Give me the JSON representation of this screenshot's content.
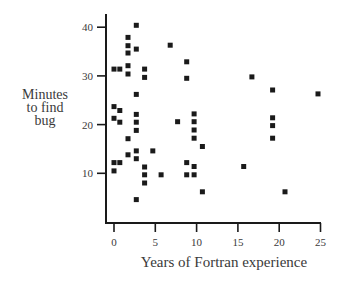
{
  "chart_data": {
    "type": "scatter",
    "title": "",
    "xlabel": "Years of Fortran experience",
    "ylabel": "Minutes to find bug",
    "ylabel_lines": [
      "Minutes",
      "to find",
      "bug"
    ],
    "xlim": [
      0,
      25
    ],
    "ylim": [
      0,
      40
    ],
    "xticks": [
      0,
      5,
      10,
      15,
      20,
      25
    ],
    "yticks": [
      10,
      20,
      30,
      40
    ],
    "grid": false,
    "legend": null,
    "marker": "square",
    "marker_color": "#1a1a1a",
    "points": [
      {
        "x": 2.7,
        "y": 40.4
      },
      {
        "x": 1.7,
        "y": 37.9
      },
      {
        "x": 1.7,
        "y": 36.2
      },
      {
        "x": 2.7,
        "y": 35.5
      },
      {
        "x": 1.7,
        "y": 34.7
      },
      {
        "x": 0.0,
        "y": 31.4
      },
      {
        "x": 0.7,
        "y": 31.4
      },
      {
        "x": 1.7,
        "y": 32.1
      },
      {
        "x": 1.7,
        "y": 30.4
      },
      {
        "x": 3.7,
        "y": 31.4
      },
      {
        "x": 3.7,
        "y": 29.7
      },
      {
        "x": 2.7,
        "y": 26.2
      },
      {
        "x": 0.0,
        "y": 23.7
      },
      {
        "x": 0.7,
        "y": 22.9
      },
      {
        "x": 2.7,
        "y": 22.1
      },
      {
        "x": 0.0,
        "y": 21.3
      },
      {
        "x": 0.7,
        "y": 20.5
      },
      {
        "x": 2.7,
        "y": 20.5
      },
      {
        "x": 2.7,
        "y": 18.8
      },
      {
        "x": 1.7,
        "y": 17.1
      },
      {
        "x": 2.7,
        "y": 14.6
      },
      {
        "x": 4.7,
        "y": 14.6
      },
      {
        "x": 1.7,
        "y": 13.8
      },
      {
        "x": 2.7,
        "y": 13.0
      },
      {
        "x": 0.0,
        "y": 12.2
      },
      {
        "x": 0.7,
        "y": 12.2
      },
      {
        "x": 0.0,
        "y": 10.5
      },
      {
        "x": 3.7,
        "y": 11.3
      },
      {
        "x": 3.7,
        "y": 9.7
      },
      {
        "x": 5.7,
        "y": 9.7
      },
      {
        "x": 3.7,
        "y": 8.0
      },
      {
        "x": 2.7,
        "y": 4.6
      },
      {
        "x": 6.8,
        "y": 36.3
      },
      {
        "x": 8.8,
        "y": 32.9
      },
      {
        "x": 8.8,
        "y": 29.5
      },
      {
        "x": 7.7,
        "y": 20.6
      },
      {
        "x": 9.7,
        "y": 22.2
      },
      {
        "x": 9.7,
        "y": 20.6
      },
      {
        "x": 9.7,
        "y": 18.9
      },
      {
        "x": 9.7,
        "y": 17.2
      },
      {
        "x": 10.7,
        "y": 15.5
      },
      {
        "x": 8.8,
        "y": 12.2
      },
      {
        "x": 9.7,
        "y": 11.4
      },
      {
        "x": 8.8,
        "y": 9.7
      },
      {
        "x": 9.7,
        "y": 9.7
      },
      {
        "x": 10.7,
        "y": 6.2
      },
      {
        "x": 16.7,
        "y": 29.8
      },
      {
        "x": 19.2,
        "y": 27.1
      },
      {
        "x": 24.7,
        "y": 26.3
      },
      {
        "x": 19.2,
        "y": 21.4
      },
      {
        "x": 19.2,
        "y": 19.8
      },
      {
        "x": 19.2,
        "y": 17.2
      },
      {
        "x": 15.7,
        "y": 11.4
      },
      {
        "x": 20.7,
        "y": 6.2
      }
    ]
  },
  "layout": {
    "origin_px": [
      114,
      222
    ],
    "px_per_x": 8.26,
    "px_per_y": 4.87,
    "axis_left_px": 106,
    "axis_top_px": 14,
    "axis_right_px": 321,
    "axis_color": "#1a1a1a",
    "text_color": "#3a3a3a"
  }
}
